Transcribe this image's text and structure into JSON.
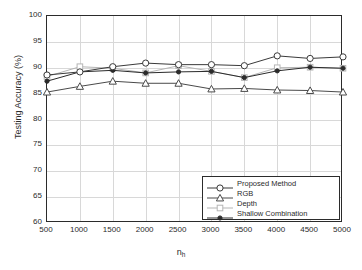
{
  "chart_data": {
    "type": "line",
    "title": "",
    "xlabel": "n_h",
    "xlabel_base": "n",
    "xlabel_sub": "h",
    "ylabel": "Testing Accuracy (%)",
    "x": [
      500,
      1000,
      1500,
      2000,
      2500,
      3000,
      3500,
      4000,
      4500,
      5000
    ],
    "xtick_labels": [
      "500",
      "1000",
      "1500",
      "2000",
      "2500",
      "3000",
      "3500",
      "4000",
      "4500",
      "5000"
    ],
    "ytick_labels": [
      "100",
      "95",
      "90",
      "85",
      "80",
      "75",
      "70",
      "65",
      "60"
    ],
    "ytick_values": [
      100,
      95,
      90,
      85,
      80,
      75,
      70,
      65,
      60
    ],
    "xlim": [
      500,
      5000
    ],
    "ylim": [
      60,
      100
    ],
    "grid": true,
    "legend_position": "lower right",
    "series": [
      {
        "name": "Proposed Method",
        "marker": "circle-open",
        "color": "#3a3a3a",
        "values": [
          88.6,
          89.2,
          90.2,
          90.9,
          90.6,
          90.6,
          90.4,
          92.3,
          91.8,
          92.1
        ]
      },
      {
        "name": "RGB",
        "marker": "triangle-open",
        "color": "#4a4a4a",
        "values": [
          85.3,
          86.4,
          87.4,
          87.0,
          87.0,
          85.9,
          86.0,
          85.7,
          85.6,
          85.3
        ]
      },
      {
        "name": "Depth",
        "marker": "square-open",
        "color": "#b5b5b5",
        "values": [
          88.3,
          90.2,
          89.9,
          89.0,
          90.4,
          89.3,
          88.1,
          90.0,
          90.1,
          89.9
        ]
      },
      {
        "name": "Shallow Combination",
        "marker": "dot-filled",
        "color": "#2b2b2b",
        "values": [
          87.4,
          89.2,
          89.5,
          89.0,
          89.2,
          89.3,
          88.1,
          89.4,
          90.1,
          89.9
        ]
      }
    ]
  }
}
